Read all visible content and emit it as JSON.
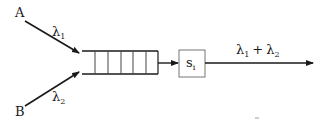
{
  "diagram": {
    "type": "queueing-network",
    "sources": [
      {
        "id": "A",
        "label": "A",
        "rate_symbol": "λ",
        "rate_sub": "1"
      },
      {
        "id": "B",
        "label": "B",
        "rate_symbol": "λ",
        "rate_sub": "2"
      }
    ],
    "queue": {
      "slots": 6
    },
    "server": {
      "symbol": "s",
      "sub": "i"
    },
    "output": {
      "sym1": "λ",
      "sub1": "1",
      "op": "+",
      "sym2": "λ",
      "sub2": "2"
    },
    "colors": {
      "line": "#1a1a1a",
      "server_border": "#777777"
    }
  }
}
